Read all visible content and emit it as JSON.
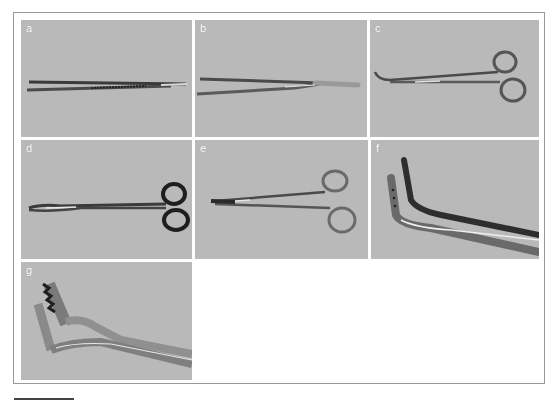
{
  "figure": {
    "panels": [
      {
        "id": "a",
        "label": "a",
        "instrument": "thumb-forceps-serrated"
      },
      {
        "id": "b",
        "label": "b",
        "instrument": "tissue-forceps"
      },
      {
        "id": "c",
        "label": "c",
        "instrument": "curved-hemostat"
      },
      {
        "id": "d",
        "label": "d",
        "instrument": "curved-scissors"
      },
      {
        "id": "e",
        "label": "e",
        "instrument": "needle-holder"
      },
      {
        "id": "f",
        "label": "f",
        "instrument": "angled-clamp"
      },
      {
        "id": "g",
        "label": "g",
        "instrument": "toothed-angled-clamp"
      }
    ],
    "caption": ""
  },
  "colors": {
    "panel_bg": "#b9b9b9",
    "frame_border": "#9a9a9a",
    "metal_dark": "#3a3a3a",
    "metal_light": "#d8d8d8"
  }
}
